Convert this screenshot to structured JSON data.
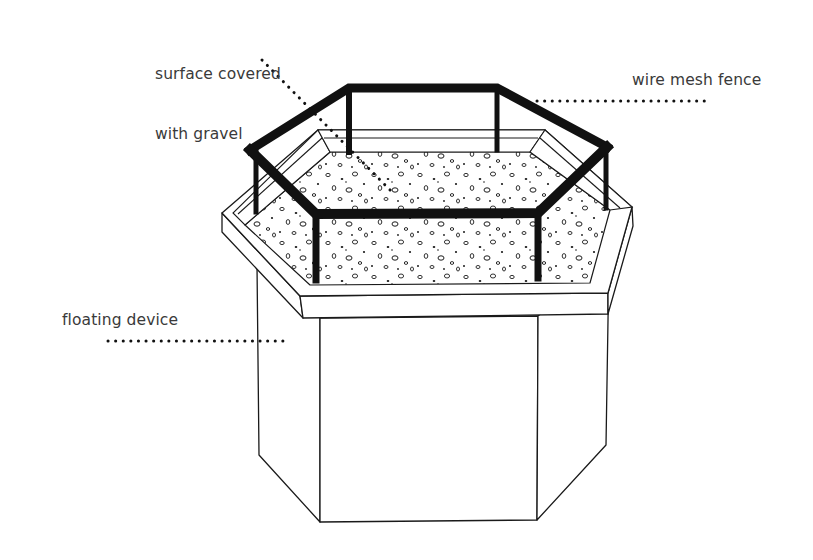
{
  "diagram": {
    "type": "technical-illustration",
    "colors": {
      "line": "#1a1a1a",
      "label_text": "#3a3a3a",
      "background": "#ffffff"
    },
    "labels": [
      {
        "id": "surface",
        "text": "surface covered\nwith gravel",
        "line1": "surface covered",
        "line2": "with gravel",
        "leader": "dotted"
      },
      {
        "id": "fence",
        "text": "wire mesh fence",
        "leader": "dotted"
      },
      {
        "id": "float",
        "text": "floating device",
        "leader": "dotted"
      }
    ]
  },
  "labels": {
    "surface_line1": "surface covered",
    "surface_line2": "with gravel",
    "fence": "wire mesh fence",
    "float": "floating device"
  }
}
